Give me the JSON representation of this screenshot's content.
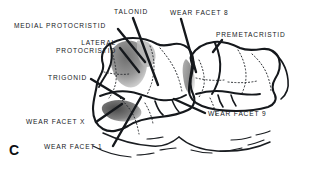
{
  "figure": {
    "panel_letter": "C",
    "background_color": "#ffffff",
    "ink_color": "#15181c",
    "shading_color": "#8d8d8d"
  },
  "labels": {
    "medial_protocristid": "MEDIAL PROTOCRISTID",
    "talonid": "TALONID",
    "wear_facet_8": "WEAR FACET 8",
    "premetacristid": "PREMETACRISTID",
    "lateral_protocristid_line1": "LATERAL",
    "lateral_protocristid_line2": "PROTOCRISTID",
    "trigonid": "TRIGONID",
    "wear_facet_x": "WEAR FACET X",
    "wear_facet_1": "WEAR FACET 1",
    "wear_facet_9": "WEAR FACET 9"
  }
}
